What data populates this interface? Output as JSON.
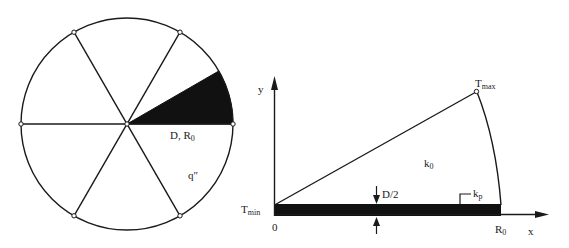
{
  "figure": {
    "left_panel": {
      "title": "Cross-section with six radial fins",
      "sector_label_main": "D, R",
      "sector_label_sub": "0",
      "heat_flux_label": "q″",
      "circle": {
        "cx": 127,
        "cy": 124,
        "r": 106
      },
      "spoke_angles_deg": [
        0,
        60,
        120,
        180,
        240,
        300
      ],
      "shaded_sector_deg": [
        0,
        30
      ],
      "colors": {
        "line": "#1a1a1a",
        "fill": "#111111",
        "background": "#ffffff"
      }
    },
    "right_panel": {
      "y_axis_label": "y",
      "x_axis_label": "x",
      "origin_label": "0",
      "r0_label_main": "R",
      "r0_label_sub": "0",
      "tmax_label_main": "T",
      "tmax_label_sub": "max",
      "tmin_label_main": "T",
      "tmin_label_sub": "min",
      "k0_label_main": "k",
      "k0_label_sub": "0",
      "kp_label_main": "k",
      "kp_label_sub": "p",
      "thickness_label": "D/2"
    }
  }
}
